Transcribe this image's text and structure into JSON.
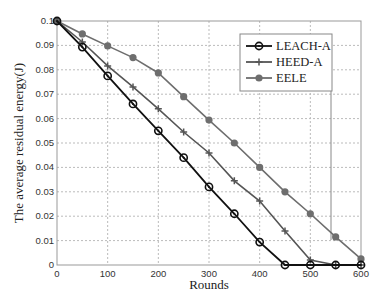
{
  "chart_data": {
    "type": "line",
    "title": "",
    "xlabel": "Rounds",
    "ylabel": "The average residual energy(J)",
    "xlim": [
      0,
      600
    ],
    "ylim": [
      0,
      0.1
    ],
    "x_ticks": [
      0,
      100,
      200,
      300,
      400,
      500,
      600
    ],
    "y_ticks": [
      0,
      0.01,
      0.02,
      0.03,
      0.04,
      0.05,
      0.06,
      0.07,
      0.08,
      0.09,
      0.1
    ],
    "y_tick_labels": [
      "0",
      "0.01",
      "0.02",
      "0.03",
      "0.04",
      "0.05",
      "0.06",
      "0.07",
      "0.08",
      "0.09",
      "0.1"
    ],
    "grid": true,
    "legend_position": "upper right",
    "x": [
      0,
      50,
      100,
      150,
      200,
      250,
      300,
      350,
      400,
      450,
      500,
      550,
      600
    ],
    "series": [
      {
        "name": "LEACH-A",
        "color": "#111111",
        "marker": "circle-open",
        "values": [
          0.1,
          0.0893,
          0.0775,
          0.066,
          0.055,
          0.044,
          0.032,
          0.021,
          0.0094,
          0,
          0,
          0,
          0
        ]
      },
      {
        "name": "HEED-A",
        "color": "#555555",
        "marker": "plus",
        "values": [
          0.1,
          0.0914,
          0.0816,
          0.073,
          0.064,
          0.0545,
          0.0459,
          0.0345,
          0.0262,
          0.0139,
          0.002,
          0,
          0
        ]
      },
      {
        "name": "EELE",
        "color": "#6e6e6e",
        "marker": "circle-filled",
        "values": [
          0.1,
          0.0947,
          0.0898,
          0.085,
          0.0787,
          0.069,
          0.0594,
          0.05,
          0.04,
          0.03,
          0.021,
          0.0115,
          0.0025
        ]
      }
    ]
  }
}
